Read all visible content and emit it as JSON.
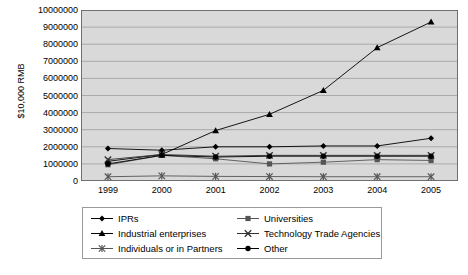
{
  "chart_data": {
    "type": "line",
    "title": "",
    "xlabel": "",
    "ylabel": "$10,000 RMB",
    "x": [
      "1999",
      "2000",
      "2001",
      "2002",
      "2003",
      "2004",
      "2005"
    ],
    "categories": [
      "1999",
      "2000",
      "2001",
      "2002",
      "2003",
      "2004",
      "2005"
    ],
    "ylim": [
      0,
      10000000
    ],
    "yticks": [
      0,
      1000000,
      2000000,
      3000000,
      4000000,
      5000000,
      6000000,
      7000000,
      8000000,
      9000000,
      10000000
    ],
    "ytick_labels": [
      "0",
      "1000000",
      "2000000",
      "3000000",
      "4000000",
      "5000000",
      "6000000",
      "7000000",
      "8000000",
      "9000000",
      "10000000"
    ],
    "grid": "horizontal",
    "plot_background": "#d9d9d9",
    "legend_position": "bottom",
    "series": [
      {
        "name": "IPRs",
        "marker": "diamond",
        "color": "#000000",
        "values": [
          1900000,
          1800000,
          2000000,
          2000000,
          2050000,
          2050000,
          2500000
        ]
      },
      {
        "name": "Universities",
        "marker": "square",
        "color": "#555555",
        "values": [
          950000,
          1500000,
          1300000,
          1000000,
          1100000,
          1250000,
          1200000
        ]
      },
      {
        "name": "Industrial enterprises",
        "marker": "triangle",
        "color": "#000000",
        "values": [
          1150000,
          1550000,
          2950000,
          3900000,
          5300000,
          7800000,
          9300000
        ]
      },
      {
        "name": "Technology Trade Agencies",
        "marker": "x",
        "color": "#333333",
        "values": [
          1250000,
          1550000,
          1450000,
          1500000,
          1500000,
          1500000,
          1500000
        ]
      },
      {
        "name": "Individuals or in Partners",
        "marker": "star",
        "color": "#555555",
        "values": [
          250000,
          300000,
          270000,
          260000,
          250000,
          250000,
          250000
        ]
      },
      {
        "name": "Other",
        "marker": "circle",
        "color": "#000000",
        "values": [
          1000000,
          1500000,
          1400000,
          1450000,
          1450000,
          1450000,
          1450000
        ]
      }
    ]
  },
  "legend": {
    "column1": [
      "IPRs",
      "Industrial enterprises",
      "Individuals or in Partners"
    ],
    "column2": [
      "Universities",
      "Technology Trade Agencies",
      "Other"
    ]
  }
}
